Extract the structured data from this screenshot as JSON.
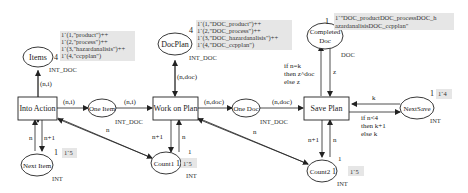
{
  "places": {
    "items": {
      "label": "Items",
      "type": "INT_DOC",
      "count": "4",
      "marking": [
        "1`(1,\"product\")++",
        "1`(2,\"process\")++",
        "1`(3,\"hazardanalisis\")++",
        "1`(4,\"ccpplan\")"
      ]
    },
    "docplan": {
      "label": "DocPlan",
      "type": "INT_DOC",
      "count": "4",
      "marking": [
        "1`(1,\"DOC_product\")++",
        "1`(2,\"DOC_process\")++",
        "1`(3,\"DOC_hazardanalisis\")++",
        "1`(4,\"DOC_ccpplan\")"
      ]
    },
    "completed": {
      "label_line1": "Completed",
      "label_line2": "Doc",
      "type": "DOC",
      "count": "1",
      "marking": [
        "1`\"DOC_productDOC_processDOC_h",
        "azardanalisisDOC_ccpplan\""
      ]
    },
    "one_item": {
      "label": "One Item",
      "type": "INT_DOC"
    },
    "one_doc": {
      "label": "One Doc",
      "type": "INT_DOC"
    },
    "next_item": {
      "label": "Next Item",
      "type": "INT",
      "count": "1",
      "marking": "1`5"
    },
    "count1": {
      "label": "Count1",
      "type": "INT",
      "count": "1",
      "marking": "1`5"
    },
    "count2": {
      "label": "Count2",
      "type": "INT",
      "count": "1",
      "marking": "1`5"
    },
    "next_save": {
      "label": "NextSave",
      "type": "INT",
      "count": "1",
      "marking": "1`4"
    }
  },
  "transitions": {
    "into_action": "Into Action",
    "work_on_plan": "Work on Plan",
    "save_plan": "Save Plan"
  },
  "arcs": {
    "items_into": "(n,i)",
    "into_oneitem": "(n,i)",
    "oneitem_work": "(n,i)",
    "docplan_work": "(n,doc)",
    "work_onedoc": "(n,doc)",
    "onedoc_save": "(n,doc)",
    "save_completed": [
      "if n=k",
      "then z^doc",
      "else z"
    ],
    "completed_save": "z",
    "nextsave_save": "k",
    "save_nextsave": [
      "if n<4",
      "then k+1",
      "else k"
    ],
    "into_nextitem": "n+1",
    "nextitem_into": "n",
    "into_count1": "n",
    "work_count1": "n+1",
    "count1_work": "n",
    "count1_mark": "1",
    "work_count2": "n",
    "save_count2": "n+1",
    "count2_save": "n",
    "count2_mark": "1"
  }
}
